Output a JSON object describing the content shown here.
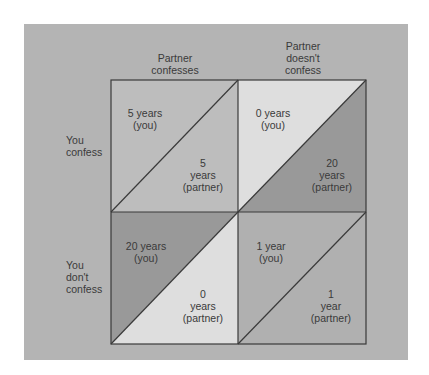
{
  "diagram": {
    "type": "payoff_matrix",
    "columns": [
      {
        "label_lines": [
          "Partner",
          "confesses"
        ]
      },
      {
        "label_lines": [
          "Partner",
          "doesn't",
          "confess"
        ]
      }
    ],
    "rows": [
      {
        "label_lines": [
          "You",
          "confess"
        ]
      },
      {
        "label_lines": [
          "You",
          "don't",
          "confess"
        ]
      }
    ],
    "cells": [
      {
        "you_lines": [
          "5 years",
          "(you)"
        ],
        "partner_lines": [
          "5",
          "years",
          "(partner)"
        ],
        "you_color": "#bdbdbd",
        "partner_color": "#bdbdbd"
      },
      {
        "you_lines": [
          "0 years",
          "(you)"
        ],
        "partner_lines": [
          "20",
          "years",
          "(partner)"
        ],
        "you_color": "#dedede",
        "partner_color": "#999999"
      },
      {
        "you_lines": [
          "20 years",
          "(you)"
        ],
        "partner_lines": [
          "0",
          "years",
          "(partner)"
        ],
        "you_color": "#999999",
        "partner_color": "#dedede"
      },
      {
        "you_lines": [
          "1 year",
          "(you)"
        ],
        "partner_lines": [
          "1",
          "year",
          "(partner)"
        ],
        "you_color": "#b0b0b0",
        "partner_color": "#b0b0b0"
      }
    ],
    "colors": {
      "panel": "#b4b4b4",
      "line": "#3a3a3a",
      "text": "#3a3a3a"
    }
  }
}
